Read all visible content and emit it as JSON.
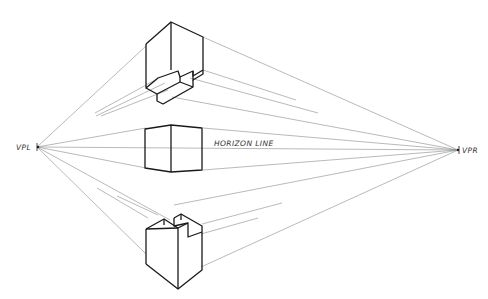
{
  "diagram": {
    "type": "two-point-perspective",
    "labels": {
      "vanishing_point_left": "VPL",
      "vanishing_point_right": "VPR",
      "horizon": "HORIZON LINE"
    },
    "objects": [
      {
        "name": "box-above-horizon",
        "description": "block with stepped notch, viewed from below"
      },
      {
        "name": "box-on-horizon",
        "description": "plain cube at eye level"
      },
      {
        "name": "box-below-horizon",
        "description": "block with slot, viewed from above"
      }
    ],
    "colors": {
      "ink": "#1a1a1a",
      "guide": "#8a8a8a",
      "background": "#ffffff"
    }
  }
}
